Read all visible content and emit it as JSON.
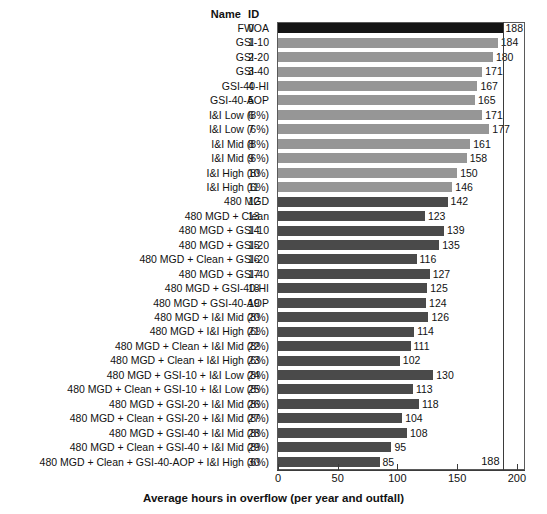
{
  "table_headers": {
    "name": "Name",
    "id": "ID"
  },
  "axis": {
    "xlabel": "Average hours in overflow (per year and outfall)",
    "ticks": [
      0,
      50,
      100,
      150,
      200
    ],
    "xmin": 0,
    "xmax": 206,
    "reference_line_value": 188,
    "reference_line_label": "188"
  },
  "colors": {
    "baseline_bar": "#141414",
    "light_group_bar": "#969696",
    "dark_group_bar": "#4a4a4a",
    "frame": "#5a5a5a",
    "text": "#111111",
    "background": "#ffffff"
  },
  "chart_data": {
    "type": "bar",
    "orientation": "horizontal",
    "title": "",
    "xlabel": "Average hours in overflow (per year and outfall)",
    "ylabel": "",
    "xlim": [
      0,
      206
    ],
    "xticks": [
      0,
      50,
      100,
      150,
      200
    ],
    "grid": false,
    "legend": "none",
    "annotations": [
      {
        "type": "vline",
        "value": 188,
        "label": "188"
      }
    ],
    "ids": [
      0,
      1,
      2,
      3,
      4,
      5,
      6,
      7,
      8,
      9,
      10,
      11,
      12,
      13,
      14,
      15,
      16,
      17,
      18,
      19,
      20,
      21,
      22,
      23,
      24,
      25,
      26,
      27,
      28,
      29,
      30
    ],
    "categories": [
      "FWOA",
      "GSI-10",
      "GSI-20",
      "GSI-40",
      "GSI-40-HI",
      "GSI-40-AOP",
      "I&I Low (8%)",
      "I&I Low (6%)",
      "I&I Mid (8%)",
      "I&I Mid (6%)",
      "I&I High (8%)",
      "I&I High (6%)",
      "480 MGD",
      "480 MGD + Clean",
      "480 MGD + GSI-10",
      "480 MGD + GSI-20",
      "480 MGD + Clean + GSI-20",
      "480 MGD + GSI-40",
      "480 MGD + GSI-40-HI",
      "480 MGD + GSI-40-AOP",
      "480 MGD + I&I Mid (8%)",
      "480 MGD + I&I High (6%)",
      "480 MGD + Clean + I&I Mid (8%)",
      "480 MGD + Clean + I&I High (6%)",
      "480 MGD + GSI-10 + I&I Low (8%)",
      "480 MGD + Clean + GSI-10 + I&I Low (8%)",
      "480 MGD + GSI-20 + I&I Mid (8%)",
      "480 MGD + Clean + GSI-20 + I&I Mid (8%)",
      "480 MGD + GSI-40 + I&I Mid (8%)",
      "480 MGD + Clean + GSI-40 + I&I Mid (8%)",
      "480 MGD + Clean + GSI-40-AOP + I&I High (6%)"
    ],
    "values": [
      188,
      184,
      180,
      171,
      167,
      165,
      171,
      177,
      161,
      158,
      150,
      146,
      142,
      123,
      139,
      135,
      116,
      127,
      125,
      124,
      126,
      114,
      111,
      102,
      130,
      113,
      118,
      104,
      108,
      95,
      85
    ],
    "value_labels": [
      "188",
      "184",
      "180",
      "171",
      "167",
      "165",
      "171",
      "177",
      "161",
      "158",
      "150",
      "146",
      "142",
      "123",
      "139",
      "135",
      "116",
      "127",
      "125",
      "124",
      "126",
      "114",
      "111",
      "102",
      "130",
      "113",
      "118",
      "104",
      "108",
      "95",
      "85"
    ],
    "bar_colors": [
      "#141414",
      "#969696",
      "#969696",
      "#969696",
      "#969696",
      "#969696",
      "#969696",
      "#969696",
      "#969696",
      "#969696",
      "#969696",
      "#969696",
      "#4a4a4a",
      "#4a4a4a",
      "#4a4a4a",
      "#4a4a4a",
      "#4a4a4a",
      "#4a4a4a",
      "#4a4a4a",
      "#4a4a4a",
      "#4a4a4a",
      "#4a4a4a",
      "#4a4a4a",
      "#4a4a4a",
      "#4a4a4a",
      "#4a4a4a",
      "#4a4a4a",
      "#4a4a4a",
      "#4a4a4a",
      "#4a4a4a",
      "#4a4a4a"
    ]
  }
}
